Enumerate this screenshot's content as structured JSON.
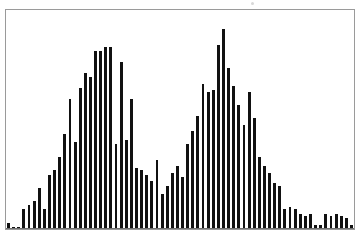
{
  "figure": {
    "title": "",
    "background_color": "#ffffff",
    "frame_color": "#9a9a9a",
    "bar_color": "#111111"
  },
  "chart_data": {
    "type": "bar",
    "title": "",
    "subtitle": "",
    "xlabel": "",
    "ylabel": "",
    "legend": [],
    "annotations": [],
    "grid": false,
    "xticks": [],
    "yticks": [],
    "xticklabels": [],
    "yticklabels": [],
    "xlim": [
      0,
      68
    ],
    "ylim": [
      0,
      100
    ],
    "distribution": "bimodal",
    "bar_count": 68,
    "categories": [
      "1",
      "2",
      "3",
      "4",
      "5",
      "6",
      "7",
      "8",
      "9",
      "10",
      "11",
      "12",
      "13",
      "14",
      "15",
      "16",
      "17",
      "18",
      "19",
      "20",
      "21",
      "22",
      "23",
      "24",
      "25",
      "26",
      "27",
      "28",
      "29",
      "30",
      "31",
      "32",
      "33",
      "34",
      "35",
      "36",
      "37",
      "38",
      "39",
      "40",
      "41",
      "42",
      "43",
      "44",
      "45",
      "46",
      "47",
      "48",
      "49",
      "50",
      "51",
      "52",
      "53",
      "54",
      "55",
      "56",
      "57",
      "58",
      "59",
      "60",
      "61",
      "62",
      "63",
      "64",
      "65",
      "66",
      "67",
      "68"
    ],
    "values": [
      3,
      1,
      1,
      9,
      11,
      13,
      19,
      9,
      25,
      27,
      33,
      44,
      60,
      40,
      65,
      72,
      70,
      82,
      82,
      84,
      84,
      39,
      77,
      41,
      60,
      28,
      27,
      25,
      22,
      32,
      16,
      20,
      26,
      29,
      24,
      39,
      45,
      52,
      67,
      63,
      64,
      85,
      92,
      74,
      66,
      57,
      48,
      63,
      51,
      33,
      29,
      26,
      21,
      20,
      9,
      10,
      9,
      7,
      6,
      7,
      2,
      2,
      7,
      6,
      7,
      6,
      5,
      2
    ]
  }
}
